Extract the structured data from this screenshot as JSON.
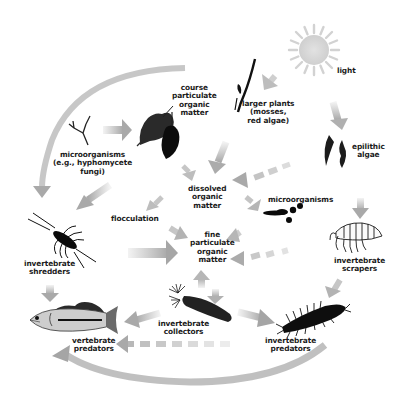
{
  "diagram": {
    "type": "food-web",
    "colors": {
      "arrow": "#b4b4b4",
      "arrow_dark": "#a0a0a0",
      "sun": "#d4d4d4",
      "organism": "#111111",
      "fish_body": "#c8c8c8",
      "background": "#ffffff"
    },
    "nodes": {
      "light": {
        "lines": [
          "light"
        ]
      },
      "larger_plants": {
        "lines": [
          "larger plants",
          "(mosses,",
          "red algae)"
        ]
      },
      "course_pom": {
        "lines": [
          "course",
          "particulate",
          "organic",
          "matter"
        ]
      },
      "microorganisms_fungi": {
        "lines": [
          "microorganisms",
          "(e.g., hyphomycete",
          "fungi)"
        ]
      },
      "epilithic_algae": {
        "lines": [
          "epilithic",
          "algae"
        ]
      },
      "dissolved_om": {
        "lines": [
          "dissolved",
          "organic",
          "matter"
        ]
      },
      "flocculation": {
        "lines": [
          "flocculation"
        ]
      },
      "microorganisms": {
        "lines": [
          "microorganisms"
        ]
      },
      "fine_pom": {
        "lines": [
          "fine",
          "particulate",
          "organic",
          "matter"
        ]
      },
      "invertebrate_shredders": {
        "lines": [
          "invertebrate",
          "shredders"
        ]
      },
      "invertebrate_scrapers": {
        "lines": [
          "invertebrate",
          "scrapers"
        ]
      },
      "invertebrate_collectors": {
        "lines": [
          "invertebrate",
          "collectors"
        ]
      },
      "invertebrate_predators": {
        "lines": [
          "invertebrate",
          "predators"
        ]
      },
      "vertebrate_predators": {
        "lines": [
          "vertebrate",
          "predators"
        ]
      }
    },
    "edges": [
      {
        "from": "light",
        "to": "larger_plants"
      },
      {
        "from": "light",
        "to": "epilithic_algae"
      },
      {
        "from": "larger_plants",
        "to": "dissolved_om"
      },
      {
        "from": "course_pom",
        "to": "invertebrate_shredders",
        "style": "curved"
      },
      {
        "from": "microorganisms_fungi",
        "to": "course_pom"
      },
      {
        "from": "course_pom",
        "to": "dissolved_om"
      },
      {
        "from": "epilithic_algae",
        "to": "dissolved_om",
        "style": "dashed"
      },
      {
        "from": "epilithic_algae",
        "to": "invertebrate_scrapers"
      },
      {
        "from": "dissolved_om",
        "to": "flocculation"
      },
      {
        "from": "dissolved_om",
        "to": "microorganisms"
      },
      {
        "from": "microorganisms_fungi",
        "to": "invertebrate_shredders"
      },
      {
        "from": "flocculation",
        "to": "fine_pom"
      },
      {
        "from": "invertebrate_shredders",
        "to": "fine_pom"
      },
      {
        "from": "microorganisms",
        "to": "fine_pom"
      },
      {
        "from": "invertebrate_scrapers",
        "to": "fine_pom",
        "style": "dashed"
      },
      {
        "from": "fine_pom",
        "to": "invertebrate_collectors"
      },
      {
        "from": "invertebrate_collectors",
        "to": "fine_pom"
      },
      {
        "from": "invertebrate_shredders",
        "to": "vertebrate_predators"
      },
      {
        "from": "invertebrate_collectors",
        "to": "vertebrate_predators"
      },
      {
        "from": "invertebrate_collectors",
        "to": "invertebrate_predators"
      },
      {
        "from": "invertebrate_scrapers",
        "to": "invertebrate_predators"
      },
      {
        "from": "invertebrate_predators",
        "to": "vertebrate_predators",
        "style": "dashed"
      },
      {
        "from": "invertebrate_predators",
        "to": "vertebrate_predators",
        "style": "curved"
      }
    ]
  }
}
